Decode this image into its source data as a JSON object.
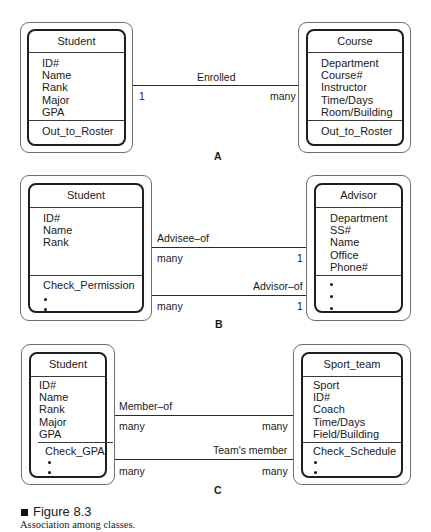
{
  "panels": {
    "A": {
      "label": "A",
      "left_class": {
        "name": "Student",
        "attributes": [
          "ID#",
          "Name",
          "Rank",
          "Major",
          "GPA"
        ],
        "methods": [
          "Out_to_Roster"
        ]
      },
      "right_class": {
        "name": "Course",
        "attributes": [
          "Department",
          "Course#",
          "Instructor",
          "Time/Days",
          "Room/Building"
        ],
        "methods": [
          "Out_to_Roster"
        ]
      },
      "associations": [
        {
          "name": "Enrolled",
          "left_multiplicity": "1",
          "right_multiplicity": "many"
        }
      ]
    },
    "B": {
      "label": "B",
      "left_class": {
        "name": "Student",
        "attributes": [
          "ID#",
          "Name",
          "Rank"
        ],
        "methods": [
          "Check_Permission"
        ],
        "more_dots": 2
      },
      "right_class": {
        "name": "Advisor",
        "attributes": [
          "Department",
          "SS#",
          "Name",
          "Office",
          "Phone#"
        ],
        "methods": [],
        "more_dots": 3
      },
      "associations": [
        {
          "name": "Advisee–of",
          "left_multiplicity": "many",
          "right_multiplicity": "1"
        },
        {
          "name": "Advisor–of",
          "left_multiplicity": "many",
          "right_multiplicity": "1"
        }
      ]
    },
    "C": {
      "label": "C",
      "left_class": {
        "name": "Student",
        "attributes": [
          "ID#",
          "Name",
          "Rank",
          "Major",
          "GPA"
        ],
        "methods": [
          "Check_GPA"
        ],
        "more_dots": 2
      },
      "right_class": {
        "name": "Sport_team",
        "attributes": [
          "Sport",
          "ID#",
          "Coach",
          "Time/Days",
          "Field/Building"
        ],
        "methods": [
          "Check_Schedule"
        ],
        "more_dots": 2
      },
      "associations": [
        {
          "name": "Member–of",
          "left_multiplicity": "many",
          "right_multiplicity": "many"
        },
        {
          "name": "Team's member",
          "left_multiplicity": "many",
          "right_multiplicity": "many"
        }
      ]
    }
  },
  "figure": {
    "icon": "square-bullet",
    "title": "Figure 8.3",
    "caption": "Association among classes."
  },
  "colors": {
    "line": "#2a2a2a",
    "outer_border": "#6e6e6e",
    "inner_border": "#1e1e1e",
    "background": "#ffffff"
  }
}
